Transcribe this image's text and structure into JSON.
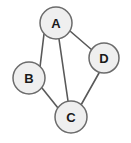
{
  "figure": {
    "background_color": "#ffffff"
  },
  "chart_data": {
    "type": "diagram",
    "subtype": "node-link-graph",
    "directed": false,
    "title": "",
    "node_style": {
      "fill": "#efefef",
      "stroke": "#6b6b6b",
      "stroke_width": 1.5,
      "radius": 16,
      "label_color": "#1a1a1a"
    },
    "edge_style": {
      "stroke": "#595959",
      "stroke_width": 1.6
    },
    "nodes": [
      {
        "id": "A",
        "label": "A",
        "x": 56,
        "y": 23,
        "r": 16
      },
      {
        "id": "B",
        "label": "B",
        "x": 29,
        "y": 78,
        "r": 16
      },
      {
        "id": "C",
        "label": "C",
        "x": 71,
        "y": 117,
        "r": 16
      },
      {
        "id": "D",
        "label": "D",
        "x": 104,
        "y": 58,
        "r": 15
      }
    ],
    "edges": [
      {
        "source": "A",
        "target": "B",
        "x1": 44,
        "y1": 34,
        "x2": 40,
        "y2": 67
      },
      {
        "source": "A",
        "target": "C",
        "x1": 59,
        "y1": 39,
        "x2": 68,
        "y2": 101
      },
      {
        "source": "A",
        "target": "D",
        "x1": 70,
        "y1": 31,
        "x2": 92,
        "y2": 50
      },
      {
        "source": "B",
        "target": "C",
        "x1": 42,
        "y1": 88,
        "x2": 58,
        "y2": 108
      },
      {
        "source": "C",
        "target": "D",
        "x1": 81,
        "y1": 105,
        "x2": 99,
        "y2": 73
      }
    ],
    "edge_count": 5,
    "node_count": 4
  }
}
